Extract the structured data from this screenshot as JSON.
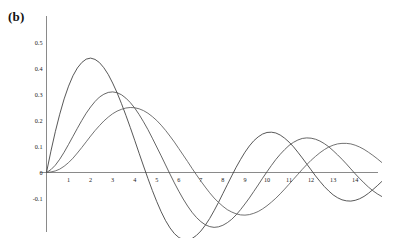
{
  "panel": {
    "label": "(b)"
  },
  "chart_data": {
    "type": "line",
    "title": "",
    "subtitle": "",
    "xlabel": "",
    "ylabel": "",
    "xlim": [
      0,
      15.2
    ],
    "ylim": [
      -0.14,
      0.55
    ],
    "grid": false,
    "legend": false,
    "legend_position": "none",
    "xticks": [
      1,
      2,
      3,
      4,
      5,
      6,
      7,
      8,
      9,
      10,
      11,
      12,
      13,
      14
    ],
    "xtick_labels": [
      "1",
      "2",
      "3",
      "4",
      "5",
      "6",
      "7",
      "8",
      "9",
      "10",
      "11",
      "12",
      "13",
      "14"
    ],
    "yticks": [
      -0.1,
      0,
      0.1,
      0.2,
      0.3,
      0.4,
      0.5
    ],
    "ytick_labels": [
      "-0.1",
      "0",
      "0.1",
      "0.2",
      "0.3",
      "0.4",
      "0.5"
    ],
    "annotations": [
      "(b)"
    ],
    "series": [
      {
        "name": "curve-1",
        "color": "#3a3a3a",
        "peak_x": 1.9,
        "peak_y": 0.44,
        "first_zero_x": 4.5,
        "x": [
          0,
          0.2,
          0.4,
          0.6,
          0.8,
          1.0,
          1.2,
          1.4,
          1.6,
          1.8,
          2.0,
          2.2,
          2.4,
          2.6,
          2.8,
          3.0,
          3.2,
          3.4,
          3.6,
          3.8,
          4.0,
          4.2,
          4.4,
          4.6,
          4.8,
          5.0,
          5.2,
          5.4,
          5.6,
          5.8,
          6.0,
          6.2,
          6.4,
          6.6,
          6.8,
          7.0,
          7.2,
          7.4,
          7.6,
          7.8,
          8.0,
          8.2,
          8.4,
          8.6,
          8.8,
          9.0,
          9.2,
          9.4,
          9.6,
          9.8,
          10.0,
          10.2,
          10.4,
          10.6,
          10.8,
          11.0,
          11.2,
          11.4,
          11.6,
          11.8,
          12.0,
          12.2,
          12.4,
          12.6,
          12.8,
          13.0,
          13.2,
          13.4,
          13.6,
          13.8,
          14.0,
          14.2,
          14.4,
          14.6,
          14.8,
          15.0,
          15.2
        ],
        "y": [
          0.0,
          0.082,
          0.157,
          0.224,
          0.283,
          0.332,
          0.372,
          0.402,
          0.423,
          0.436,
          0.44,
          0.435,
          0.423,
          0.403,
          0.377,
          0.344,
          0.307,
          0.265,
          0.22,
          0.173,
          0.124,
          0.074,
          0.025,
          -0.023,
          -0.069,
          -0.112,
          -0.151,
          -0.185,
          -0.213,
          -0.235,
          -0.25,
          -0.258,
          -0.259,
          -0.254,
          -0.242,
          -0.225,
          -0.203,
          -0.177,
          -0.147,
          -0.115,
          -0.081,
          -0.047,
          -0.013,
          0.02,
          0.05,
          0.078,
          0.102,
          0.122,
          0.137,
          0.148,
          0.154,
          0.155,
          0.152,
          0.144,
          0.132,
          0.117,
          0.099,
          0.078,
          0.056,
          0.033,
          0.01,
          -0.013,
          -0.034,
          -0.054,
          -0.071,
          -0.086,
          -0.097,
          -0.105,
          -0.109,
          -0.11,
          -0.107,
          -0.101,
          -0.092,
          -0.08,
          -0.066,
          -0.051,
          -0.035
        ]
      },
      {
        "name": "curve-2",
        "color": "#4a4a4a",
        "peak_x": 3.1,
        "peak_y": 0.31,
        "first_zero_x": 6.2,
        "x": [
          0,
          0.2,
          0.4,
          0.6,
          0.8,
          1.0,
          1.2,
          1.4,
          1.6,
          1.8,
          2.0,
          2.2,
          2.4,
          2.6,
          2.8,
          3.0,
          3.2,
          3.4,
          3.6,
          3.8,
          4.0,
          4.2,
          4.4,
          4.6,
          4.8,
          5.0,
          5.2,
          5.4,
          5.6,
          5.8,
          6.0,
          6.2,
          6.4,
          6.6,
          6.8,
          7.0,
          7.2,
          7.4,
          7.6,
          7.8,
          8.0,
          8.2,
          8.4,
          8.6,
          8.8,
          9.0,
          9.2,
          9.4,
          9.6,
          9.8,
          10.0,
          10.2,
          10.4,
          10.6,
          10.8,
          11.0,
          11.2,
          11.4,
          11.6,
          11.8,
          12.0,
          12.2,
          12.4,
          12.6,
          12.8,
          13.0,
          13.2,
          13.4,
          13.6,
          13.8,
          14.0,
          14.2,
          14.4,
          14.6,
          14.8,
          15.0,
          15.2
        ],
        "y": [
          0.0,
          0.011,
          0.028,
          0.051,
          0.078,
          0.108,
          0.139,
          0.17,
          0.2,
          0.228,
          0.252,
          0.273,
          0.29,
          0.301,
          0.308,
          0.31,
          0.307,
          0.299,
          0.286,
          0.269,
          0.248,
          0.223,
          0.195,
          0.165,
          0.132,
          0.098,
          0.064,
          0.029,
          -0.006,
          -0.04,
          -0.072,
          -0.102,
          -0.129,
          -0.153,
          -0.173,
          -0.189,
          -0.201,
          -0.208,
          -0.211,
          -0.209,
          -0.203,
          -0.193,
          -0.18,
          -0.163,
          -0.143,
          -0.121,
          -0.098,
          -0.073,
          -0.048,
          -0.022,
          0.003,
          0.027,
          0.05,
          0.07,
          0.088,
          0.104,
          0.116,
          0.125,
          0.131,
          0.133,
          0.132,
          0.128,
          0.121,
          0.111,
          0.099,
          0.084,
          0.068,
          0.051,
          0.033,
          0.014,
          -0.005,
          -0.023,
          -0.04,
          -0.056,
          -0.07,
          -0.082,
          -0.092
        ]
      },
      {
        "name": "curve-3",
        "color": "#5a5a5a",
        "peak_x": 4.3,
        "peak_y": 0.25,
        "first_zero_x": 7.4,
        "x": [
          0,
          0.2,
          0.4,
          0.6,
          0.8,
          1.0,
          1.2,
          1.4,
          1.6,
          1.8,
          2.0,
          2.2,
          2.4,
          2.6,
          2.8,
          3.0,
          3.2,
          3.4,
          3.6,
          3.8,
          4.0,
          4.2,
          4.4,
          4.6,
          4.8,
          5.0,
          5.2,
          5.4,
          5.6,
          5.8,
          6.0,
          6.2,
          6.4,
          6.6,
          6.8,
          7.0,
          7.2,
          7.4,
          7.6,
          7.8,
          8.0,
          8.2,
          8.4,
          8.6,
          8.8,
          9.0,
          9.2,
          9.4,
          9.6,
          9.8,
          10.0,
          10.2,
          10.4,
          10.6,
          10.8,
          11.0,
          11.2,
          11.4,
          11.6,
          11.8,
          12.0,
          12.2,
          12.4,
          12.6,
          12.8,
          13.0,
          13.2,
          13.4,
          13.6,
          13.8,
          14.0,
          14.2,
          14.4,
          14.6,
          14.8,
          15.0,
          15.2
        ],
        "y": [
          0.0,
          0.002,
          0.006,
          0.013,
          0.024,
          0.038,
          0.055,
          0.075,
          0.096,
          0.118,
          0.14,
          0.161,
          0.18,
          0.198,
          0.213,
          0.226,
          0.236,
          0.243,
          0.248,
          0.25,
          0.249,
          0.245,
          0.238,
          0.228,
          0.215,
          0.2,
          0.182,
          0.162,
          0.14,
          0.117,
          0.092,
          0.067,
          0.042,
          0.016,
          -0.009,
          -0.033,
          -0.056,
          -0.078,
          -0.098,
          -0.115,
          -0.13,
          -0.143,
          -0.152,
          -0.159,
          -0.163,
          -0.164,
          -0.162,
          -0.157,
          -0.15,
          -0.14,
          -0.128,
          -0.114,
          -0.099,
          -0.082,
          -0.064,
          -0.045,
          -0.026,
          -0.007,
          0.012,
          0.03,
          0.047,
          0.062,
          0.076,
          0.088,
          0.098,
          0.105,
          0.11,
          0.112,
          0.112,
          0.11,
          0.105,
          0.098,
          0.089,
          0.078,
          0.066,
          0.053,
          0.039
        ]
      }
    ]
  }
}
